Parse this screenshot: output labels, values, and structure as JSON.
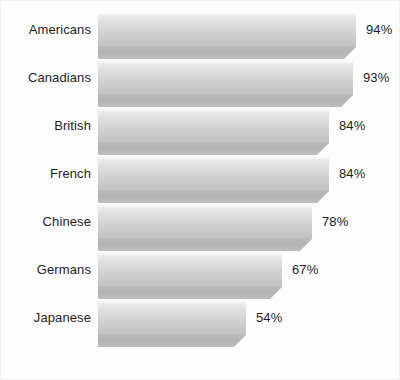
{
  "chart_data": {
    "type": "bar",
    "orientation": "horizontal",
    "title": "",
    "subtitle": "",
    "xlabel": "",
    "ylabel": "",
    "xlim": [
      0,
      100
    ],
    "grid": false,
    "legend": null,
    "value_suffix": "%",
    "categories": [
      "Americans",
      "Canadians",
      "British",
      "French",
      "Chinese",
      "Germans",
      "Japanese"
    ],
    "values": [
      94,
      93,
      84,
      84,
      78,
      67,
      54
    ],
    "labels": [
      "94%",
      "93%",
      "84%",
      "84%",
      "78%",
      "67%",
      "54%"
    ],
    "series": [
      {
        "name": "",
        "values": [
          94,
          93,
          84,
          84,
          78,
          67,
          54
        ]
      }
    ],
    "bars": [
      {
        "category": "Americans",
        "value": 94,
        "label": "94%"
      },
      {
        "category": "Canadians",
        "value": 93,
        "label": "93%"
      },
      {
        "category": "British",
        "value": 84,
        "label": "84%"
      },
      {
        "category": "French",
        "value": 84,
        "label": "84%"
      },
      {
        "category": "Chinese",
        "value": 78,
        "label": "78%"
      },
      {
        "category": "Germans",
        "value": 67,
        "label": "67%"
      },
      {
        "category": "Japanese",
        "value": 54,
        "label": "54%"
      }
    ]
  },
  "style": {
    "background": "#fdfdfd",
    "bar_top_color": "#e4e4e4",
    "bar_bottom_color": "#c0c0c0",
    "bar_front_color": "#b4b4b4",
    "text_color": "#1d1d1d",
    "border_color": "#f2f2f2"
  },
  "layout": {
    "plot_left_px": 97,
    "label_right_px": 90,
    "row_height_px": 48,
    "first_row_top_px": 12,
    "bar_px_per_unit": 2.745,
    "value_gap_px": 10
  }
}
